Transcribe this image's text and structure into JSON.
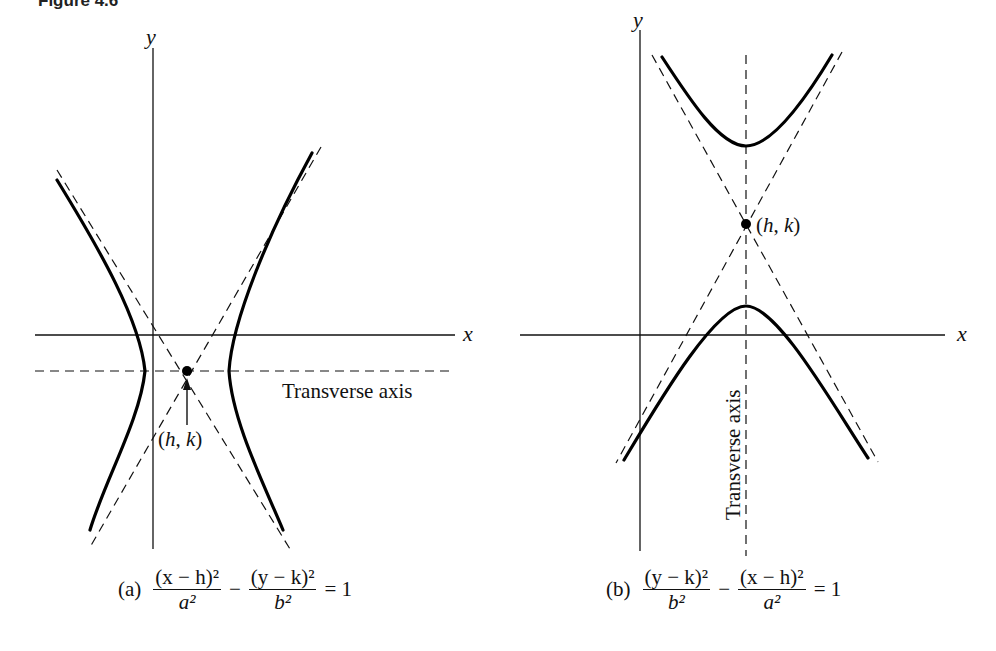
{
  "figure": {
    "title": "Figure 4.6"
  },
  "panel_a": {
    "y_axis_label": "y",
    "x_axis_label": "x",
    "center_label": "(h, k)",
    "transverse_axis_label": "Transverse axis",
    "caption": {
      "tag": "(a)",
      "term1_num": "(x − h)²",
      "term1_den": "a²",
      "operator": "−",
      "term2_num": "(y − k)²",
      "term2_den": "b²",
      "equals": "= 1"
    }
  },
  "panel_b": {
    "y_axis_label": "y",
    "x_axis_label": "x",
    "center_label": "(h, k)",
    "transverse_axis_label": "Transverse axis",
    "caption": {
      "tag": "(b)",
      "term1_num": "(y − k)²",
      "term1_den": "b²",
      "operator": "−",
      "term2_num": "(x − h)²",
      "term2_den": "a²",
      "equals": "= 1"
    }
  },
  "colors": {
    "ink": "#111111",
    "background": "#ffffff"
  }
}
